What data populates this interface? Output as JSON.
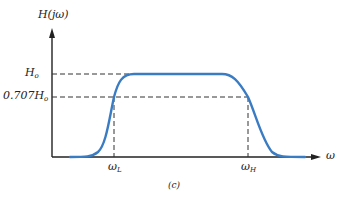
{
  "diagram": {
    "type": "bandpass-frequency-response",
    "y_axis_label": "H(jω)",
    "x_axis_label": "ω",
    "levels": [
      {
        "name": "H_o",
        "label_main": "H",
        "label_sub": "o"
      },
      {
        "name": "0.707H_o",
        "label_main": "0.707H",
        "label_sub": "o"
      }
    ],
    "frequencies": [
      {
        "name": "omega_L",
        "label_main": "ω",
        "label_sub": "L"
      },
      {
        "name": "omega_H",
        "label_main": "ω",
        "label_sub": "H"
      }
    ],
    "caption": "(c)",
    "curve_color": "#3a7cc4",
    "axis_color": "#222222"
  }
}
